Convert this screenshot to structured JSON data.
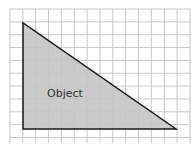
{
  "diagram": {
    "label": "Object",
    "colors": {
      "grid": "#c8c8c8",
      "fill": "#c4c4c4",
      "stroke": "#1a1a1a",
      "text": "#333333"
    },
    "grid": {
      "x0": 10,
      "y0": 9,
      "cell": 12.85,
      "cols": 14,
      "rows": 10.4
    },
    "triangle": {
      "vertices": [
        [
          23,
          23
        ],
        [
          23,
          129
        ],
        [
          176,
          129
        ]
      ]
    }
  }
}
